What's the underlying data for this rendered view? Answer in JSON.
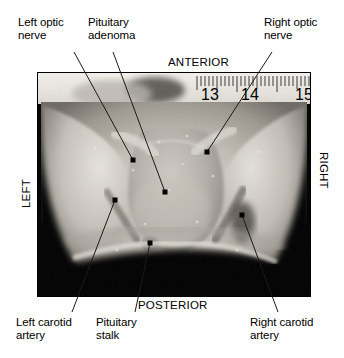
{
  "figure": {
    "photo": {
      "kind": "gross-anatomic-photograph",
      "modality": "color-photograph-grayscale",
      "description": "Superior view of sella turcica region showing pituitary adenoma"
    }
  },
  "orientation": {
    "anterior": "ANTERIOR",
    "posterior": "POSTERIOR",
    "left": "LEFT",
    "right": "RIGHT"
  },
  "ruler": {
    "unit": "cm",
    "tick_labels": [
      "13",
      "14",
      "15"
    ]
  },
  "annotations": [
    {
      "id": "left-optic-nerve",
      "label": "Left optic\nnerve",
      "label_x": 18,
      "label_y": 22,
      "leader": {
        "x1": 74,
        "y1": 52,
        "x2": 133,
        "y2": 160
      }
    },
    {
      "id": "pituitary-adenoma",
      "label": "Pituitary\nadenoma",
      "label_x": 88,
      "label_y": 22,
      "leader": {
        "x1": 113,
        "y1": 52,
        "x2": 165,
        "y2": 192
      }
    },
    {
      "id": "right-optic-nerve",
      "label": "Right optic\nnerve",
      "label_x": 264,
      "label_y": 22,
      "leader": {
        "x1": 272,
        "y1": 52,
        "x2": 207,
        "y2": 152
      }
    },
    {
      "id": "left-carotid-artery",
      "label": "Left carotid\nartery",
      "label_x": 18,
      "label_y": 320,
      "leader": {
        "x1": 72,
        "y1": 312,
        "x2": 115,
        "y2": 200
      }
    },
    {
      "id": "pituitary-stalk",
      "label": "Pituitary\nstalk",
      "label_x": 96,
      "label_y": 320,
      "leader": {
        "x1": 135,
        "y1": 312,
        "x2": 150,
        "y2": 243
      }
    },
    {
      "id": "right-carotid-artery",
      "label": "Right carotid\nartery",
      "label_x": 252,
      "label_y": 320,
      "leader": {
        "x1": 278,
        "y1": 312,
        "x2": 242,
        "y2": 215
      }
    }
  ],
  "colors": {
    "background": "#ffffff",
    "text": "#000000",
    "leader": "#1a1a1a",
    "photo_void": "#000000"
  }
}
